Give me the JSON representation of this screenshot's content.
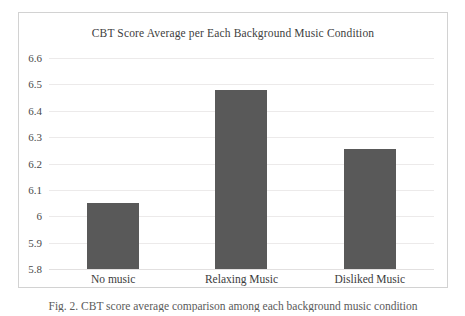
{
  "figure": {
    "caption": "Fig. 2.  CBT score average comparison among each background music condition"
  },
  "chart_data": {
    "type": "bar",
    "title": "CBT Score Average per Each Background Music Condition",
    "xlabel": "",
    "ylabel": "",
    "categories": [
      "No music",
      "Relaxing Music",
      "Disliked Music"
    ],
    "values": [
      6.05,
      6.48,
      6.255
    ],
    "series": [
      {
        "name": "CBT Score Average",
        "values": [
          6.05,
          6.48,
          6.255
        ]
      }
    ],
    "ylim": [
      5.8,
      6.6
    ],
    "ytick_step": 0.1,
    "ytick_labels": [
      "6.6",
      "6.5",
      "6.4",
      "6.3",
      "6.2",
      "6.1",
      "6",
      "5.9",
      "5.8"
    ],
    "ytick_values": [
      6.6,
      6.5,
      6.4,
      6.3,
      6.2,
      6.1,
      6.0,
      5.9,
      5.8
    ],
    "grid": true,
    "legend": false,
    "legend_position": "none",
    "bar_color": "#595959",
    "gridline_color": "#eceaea",
    "plot_background": "#ffffff",
    "border_color": "#d2d2d2"
  }
}
